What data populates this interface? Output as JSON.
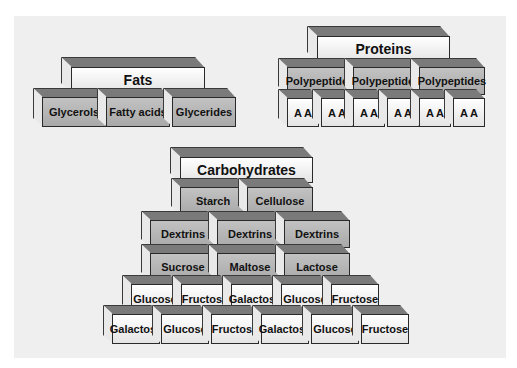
{
  "diagram": {
    "type": "block-pyramids",
    "colors": {
      "background": "#efefef",
      "top_face": "#7a7a7a",
      "side_face": "#e9e9e9",
      "white_block": "#f6f6f6",
      "gray_block": "#b8b8b8"
    },
    "groups": {
      "fats": {
        "title": "Fats",
        "components": [
          "Glycerols",
          "Fatty acids",
          "Glycerides"
        ]
      },
      "proteins": {
        "title": "Proteins",
        "polypeptides": [
          "Polypeptides",
          "Polypeptides",
          "Polypeptides"
        ],
        "amino_acids": [
          "A A",
          "A A",
          "A A",
          "A A",
          "A A",
          "A A"
        ]
      },
      "carbohydrates": {
        "title": "Carbohydrates",
        "polysaccharides": [
          "Starch",
          "Cellulose"
        ],
        "dextrins": [
          "Dextrins",
          "Dextrins",
          "Dextrins"
        ],
        "disaccharides": [
          "Sucrose",
          "Maltose",
          "Lactose"
        ],
        "monosaccharides_row1": [
          "Glucose",
          "Fructose",
          "Galactose",
          "Glucose",
          "Fructose"
        ],
        "monosaccharides_row2": [
          "Galactose",
          "Glucose",
          "Fructose",
          "Galactose",
          "Glucose",
          "Fructose"
        ]
      }
    }
  }
}
